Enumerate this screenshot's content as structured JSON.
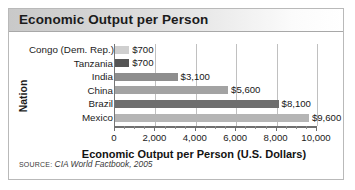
{
  "chart_data": {
    "type": "bar",
    "orientation": "horizontal",
    "title": "Economic Output per Person",
    "xlabel": "Economic Output per Person (U.S. Dollars)",
    "ylabel": "Nation",
    "categories": [
      "Congo (Dem. Rep.)",
      "Tanzania",
      "India",
      "China",
      "Brazil",
      "Mexico"
    ],
    "values": [
      700,
      700,
      3100,
      5600,
      8100,
      9600
    ],
    "value_labels": [
      "$700",
      "$700",
      "$3,100",
      "$5,600",
      "$8,100",
      "$9,600"
    ],
    "bar_colors": [
      "#cfcfcf",
      "#555555",
      "#8e8e8e",
      "#a3a3a3",
      "#6e6e6e",
      "#b5b5b5"
    ],
    "xlim": [
      0,
      10000
    ],
    "xticks": [
      0,
      2000,
      4000,
      6000,
      8000,
      10000
    ],
    "xtick_labels": [
      "0",
      "2,000",
      "4,000",
      "6,000",
      "8,000",
      "10,000"
    ],
    "minor_tick_interval": 500,
    "grid": "vertical",
    "legend": "none",
    "source_keyword": "SOURCE:",
    "source_text": "CIA World Factbook, 2005"
  }
}
